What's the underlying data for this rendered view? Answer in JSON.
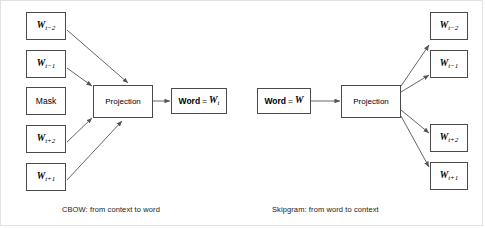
{
  "figure": {
    "frame_color": "#e2e2e2",
    "box_border_color": "#4a4a4a",
    "arrow_color": "#5a5a5a",
    "background": "#ffffff"
  },
  "cbow": {
    "caption": "CBOW: from context to word",
    "projection_label": "Projection",
    "inputs": [
      {
        "base": "W",
        "sub": "t−2",
        "kind": "variable"
      },
      {
        "base": "W",
        "sub": "t−1",
        "kind": "variable"
      },
      {
        "base": "Mask",
        "sub": "",
        "kind": "text"
      },
      {
        "base": "W",
        "sub": "t+2",
        "kind": "variable"
      },
      {
        "base": "W",
        "sub": "t+1",
        "kind": "variable"
      }
    ],
    "output": {
      "prefix": "Word",
      "equals": "=",
      "base": "W",
      "sub": "t"
    }
  },
  "skipgram": {
    "caption": "Skipgram: from word to context",
    "projection_label": "Projection",
    "input": {
      "prefix": "Word",
      "equals": "=",
      "base": "W",
      "sub": ""
    },
    "outputs": [
      {
        "base": "W",
        "sub": "t−2",
        "kind": "variable"
      },
      {
        "base": "W",
        "sub": "t−1",
        "kind": "variable"
      },
      {
        "base": "W",
        "sub": "t+2",
        "kind": "variable"
      },
      {
        "base": "W",
        "sub": "t+1",
        "kind": "variable"
      }
    ]
  }
}
